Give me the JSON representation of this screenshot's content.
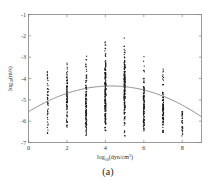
{
  "figure": {
    "caption": "(a)"
  },
  "chart_data": {
    "type": "scatter",
    "title": "",
    "xlabel": "log10(dyn/cm^3)",
    "xlabel_parts": {
      "base": "log",
      "subscript": "10",
      "open": "(dyn/cm",
      "superscript": "3",
      "close": ")"
    },
    "ylabel": "log10(m/s)",
    "ylabel_parts": {
      "base": "log",
      "subscript": "10",
      "open": "(m/s",
      "close": ")"
    },
    "xlim": [
      0,
      9
    ],
    "ylim": [
      -7,
      -1
    ],
    "xticks": [
      0,
      2,
      4,
      6,
      8
    ],
    "xticklabels": [
      "0",
      "2",
      "4",
      "6",
      "8"
    ],
    "yticks": [
      -7,
      -6,
      -5,
      -4,
      -3,
      -2,
      -1
    ],
    "yticklabels": [
      "-7",
      "-6",
      "-5",
      "-4",
      "-3",
      "-2",
      "-1"
    ],
    "grid": false,
    "legend": null,
    "marker": "square",
    "marker_color": "#1a1a1a",
    "marker_size": 1.1,
    "fit_color": "#787878",
    "fit": {
      "type": "quadratic",
      "vertex_x": 4.3,
      "vertex_y": -4.35,
      "curvature": -0.0655,
      "x_range": [
        0,
        9
      ]
    },
    "clusters": [
      {
        "x": 1,
        "n": 46,
        "ymin": -6.65,
        "ymax": -3.55,
        "ycenter": -5.25,
        "spread": 0.95,
        "density": "sparse"
      },
      {
        "x": 2,
        "n": 86,
        "ymin": -6.35,
        "ymax": -3.25,
        "ycenter": -4.95,
        "spread": 0.85,
        "density": "medium"
      },
      {
        "x": 3,
        "n": 120,
        "ymin": -6.85,
        "ymax": -2.85,
        "ycenter": -5.05,
        "spread": 0.95,
        "density": "dense"
      },
      {
        "x": 4,
        "n": 190,
        "ymin": -6.55,
        "ymax": -1.75,
        "ycenter": -4.65,
        "spread": 1.05,
        "density": "very-dense"
      },
      {
        "x": 5,
        "n": 185,
        "ymin": -6.75,
        "ymax": -1.65,
        "ycenter": -4.75,
        "spread": 1.0,
        "density": "very-dense"
      },
      {
        "x": 6,
        "n": 110,
        "ymin": -6.45,
        "ymax": -2.65,
        "ycenter": -5.15,
        "spread": 0.9,
        "density": "dense"
      },
      {
        "x": 7,
        "n": 92,
        "ymin": -6.55,
        "ymax": -3.25,
        "ycenter": -5.35,
        "spread": 0.85,
        "density": "medium"
      },
      {
        "x": 8,
        "n": 30,
        "ymin": -6.75,
        "ymax": -5.35,
        "ycenter": -6.1,
        "spread": 0.42,
        "density": "sparse"
      }
    ]
  }
}
